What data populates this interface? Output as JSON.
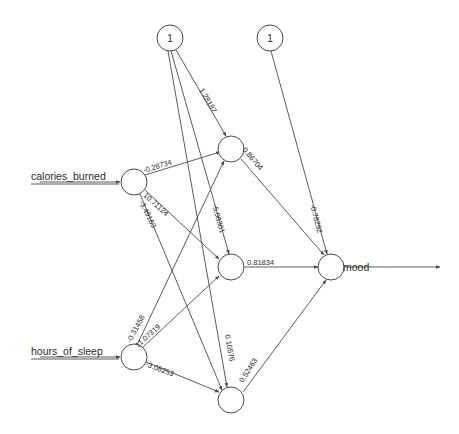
{
  "diagram": {
    "inputs": [
      {
        "id": "calories_burned",
        "label": "calories_burned"
      },
      {
        "id": "hours_of_sleep",
        "label": "hours_of_sleep"
      }
    ],
    "outputs": [
      {
        "id": "mood",
        "label": "mood"
      }
    ],
    "bias_nodes": [
      {
        "id": "bias_hidden",
        "label": "1"
      },
      {
        "id": "bias_output",
        "label": "1"
      }
    ],
    "hidden_nodes": [
      {
        "id": "h1",
        "label": ""
      },
      {
        "id": "h2",
        "label": ""
      },
      {
        "id": "h3",
        "label": ""
      }
    ],
    "edges": [
      {
        "from": "bias_hidden",
        "to": "h1",
        "weight": "1.28187"
      },
      {
        "from": "bias_hidden",
        "to": "h2",
        "weight": "-5.08301"
      },
      {
        "from": "bias_hidden",
        "to": "h3",
        "weight": "0.10576"
      },
      {
        "from": "bias_output",
        "to": "mood",
        "weight": "-0.78292"
      },
      {
        "from": "calories_burned",
        "to": "h1",
        "weight": "-0.28734"
      },
      {
        "from": "calories_burned",
        "to": "h2",
        "weight": "10.71124"
      },
      {
        "from": "calories_burned",
        "to": "h3",
        "weight": "-3.49163"
      },
      {
        "from": "hours_of_sleep",
        "to": "h1",
        "weight": "-0.31458"
      },
      {
        "from": "hours_of_sleep",
        "to": "h2",
        "weight": "11.07319"
      },
      {
        "from": "hours_of_sleep",
        "to": "h3",
        "weight": "-3.08253"
      },
      {
        "from": "h1",
        "to": "mood",
        "weight": "0.86704"
      },
      {
        "from": "h2",
        "to": "mood",
        "weight": "0.81834"
      },
      {
        "from": "h3",
        "to": "mood",
        "weight": "0.52463"
      }
    ],
    "colors": {
      "stroke": "#4a4a4a",
      "node_fill": "#ffffff",
      "text": "#2b2b2b",
      "background": "#ffffff"
    }
  }
}
